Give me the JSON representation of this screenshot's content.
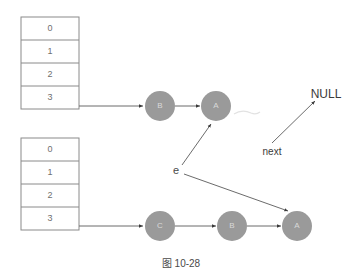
{
  "caption": "图 10-28",
  "tables": [
    {
      "name": "top-index-table",
      "rows": [
        "0",
        "1",
        "2",
        "3"
      ]
    },
    {
      "name": "bottom-index-table",
      "rows": [
        "0",
        "1",
        "2",
        "3"
      ]
    }
  ],
  "top_chain": {
    "nodes": [
      {
        "label": "B"
      },
      {
        "label": "A"
      }
    ]
  },
  "bottom_chain": {
    "nodes": [
      {
        "label": "C"
      },
      {
        "label": "B"
      },
      {
        "label": "A"
      }
    ]
  },
  "annotations": {
    "null_label": "NULL",
    "next_label": "next",
    "pointer_label": "e"
  },
  "colors": {
    "node_fill": "#9a9a9a",
    "node_text": "#d9d9d9",
    "table_stroke": "#8a8a8a",
    "edge": "#6b6b6b",
    "text": "#3a3a3a",
    "background": "#ffffff"
  }
}
